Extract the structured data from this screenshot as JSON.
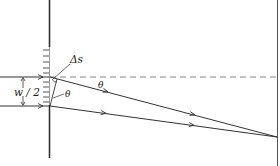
{
  "figure": {
    "labels": {
      "half_width": "w / 2",
      "path_difference": "Δs",
      "angle_upper": "θ",
      "angle_lower": "θ"
    },
    "colors": {
      "line": "#333333",
      "dashed": "#777777",
      "background": "#ffffff"
    }
  }
}
